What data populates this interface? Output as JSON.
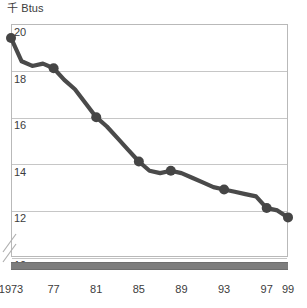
{
  "unit_label": "千 Btus",
  "unit_label_prefix": "千",
  "unit_label_suffix": " Btus",
  "colors": {
    "line": "#4a4a4a",
    "marker": "#454545",
    "gridline": "#c6c6c6",
    "frame": "#b9b9b9",
    "axis_bar": "#7d7d7d",
    "text": "#3c3c3c",
    "background": "#ffffff"
  },
  "axis_break": {
    "present": true,
    "name": "y-axis-break-marks",
    "description": "double slash break below 10"
  },
  "chart_data": {
    "type": "line",
    "title": "千 Btus",
    "xlabel": "",
    "ylabel": "千 Btus",
    "ylim": [
      10,
      20
    ],
    "xlim": [
      1973,
      1999
    ],
    "grid": true,
    "legend": false,
    "legend_position": "none",
    "y_axis_break": true,
    "ytick_labels": [
      "20",
      "18",
      "16",
      "14",
      "12",
      "10"
    ],
    "ytick_values": [
      20,
      18,
      16,
      14,
      12,
      10
    ],
    "xtick_labels": [
      "1973",
      "77",
      "81",
      "85",
      "89",
      "93",
      "97",
      "99"
    ],
    "xtick_values": [
      1973,
      1977,
      1981,
      1985,
      1989,
      1993,
      1997,
      1999
    ],
    "x": [
      1973,
      1974,
      1975,
      1976,
      1977,
      1978,
      1979,
      1980,
      1981,
      1982,
      1983,
      1984,
      1985,
      1986,
      1987,
      1988,
      1989,
      1990,
      1991,
      1992,
      1993,
      1994,
      1995,
      1996,
      1997,
      1998,
      1999
    ],
    "values": [
      19.4,
      18.4,
      18.2,
      18.3,
      18.1,
      17.6,
      17.2,
      16.6,
      16.0,
      15.6,
      15.1,
      14.6,
      14.1,
      13.7,
      13.6,
      13.7,
      13.6,
      13.4,
      13.2,
      13.0,
      12.9,
      12.8,
      12.7,
      12.6,
      12.1,
      12.0,
      11.7
    ],
    "markers": [
      {
        "x": 1973,
        "y": 19.4
      },
      {
        "x": 1977,
        "y": 18.1
      },
      {
        "x": 1981,
        "y": 16.0
      },
      {
        "x": 1985,
        "y": 14.1
      },
      {
        "x": 1988,
        "y": 13.7
      },
      {
        "x": 1993,
        "y": 12.9
      },
      {
        "x": 1997,
        "y": 12.1
      },
      {
        "x": 1999,
        "y": 11.7
      }
    ],
    "series": [
      {
        "name": "series-1",
        "values": [
          19.4,
          18.4,
          18.2,
          18.3,
          18.1,
          17.6,
          17.2,
          16.6,
          16.0,
          15.6,
          15.1,
          14.6,
          14.1,
          13.7,
          13.6,
          13.7,
          13.6,
          13.4,
          13.2,
          13.0,
          12.9,
          12.8,
          12.7,
          12.6,
          12.1,
          12.0,
          11.7
        ]
      }
    ]
  }
}
